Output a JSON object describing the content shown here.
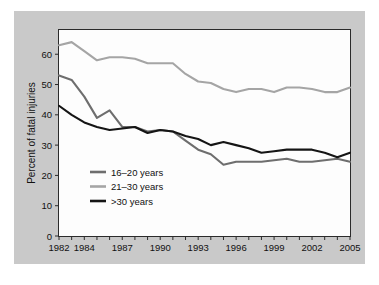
{
  "figure": {
    "background_color": "#ffffff",
    "matte_color": "#c9c9c9",
    "plot_background_color": "#fdfdfd",
    "plot_border_color": "#2b2b2b"
  },
  "chart_data": {
    "type": "line",
    "title": "",
    "xlabel": "",
    "ylabel": "Percent of fatal injuries",
    "xlim": [
      1982,
      2005
    ],
    "ylim": [
      0,
      68
    ],
    "yticks": [
      0,
      10,
      20,
      30,
      40,
      50,
      60
    ],
    "ytick_labels": [
      "0",
      "10",
      "20",
      "30",
      "40",
      "50",
      "60"
    ],
    "xticks": [
      1982,
      1983,
      1984,
      1985,
      1986,
      1987,
      1988,
      1989,
      1990,
      1991,
      1992,
      1993,
      1994,
      1995,
      1996,
      1997,
      1998,
      1999,
      2000,
      2001,
      2002,
      2003,
      2004,
      2005
    ],
    "xtick_labels_shown": [
      "1982",
      "1984",
      "1987",
      "1990",
      "1993",
      "1996",
      "1999",
      "2002",
      "2005"
    ],
    "xtick_label_years": [
      1982,
      1984,
      1987,
      1990,
      1993,
      1996,
      1999,
      2002,
      2005
    ],
    "grid": false,
    "legend_position": "lower left inside plot",
    "x": [
      1982,
      1983,
      1984,
      1985,
      1986,
      1987,
      1988,
      1989,
      1990,
      1991,
      1992,
      1993,
      1994,
      1995,
      1996,
      1997,
      1998,
      1999,
      2000,
      2001,
      2002,
      2003,
      2004,
      2005
    ],
    "series": [
      {
        "name": "16-20 years",
        "label": "16–20 years",
        "color": "#6e6e6e",
        "values": [
          53.0,
          51.5,
          46.0,
          39.0,
          41.5,
          36.0,
          36.0,
          34.5,
          35.0,
          34.5,
          31.5,
          28.5,
          27.0,
          23.5,
          24.5,
          24.5,
          24.5,
          25.0,
          25.5,
          24.5,
          24.5,
          25.0,
          25.5,
          24.5
        ]
      },
      {
        "name": "21-30 years",
        "label": "21–30 years",
        "color": "#a5a5a5",
        "values": [
          63.0,
          64.0,
          61.0,
          58.0,
          59.0,
          59.0,
          58.5,
          57.0,
          57.0,
          57.0,
          53.5,
          51.0,
          50.5,
          48.5,
          47.5,
          48.5,
          48.5,
          47.5,
          49.0,
          49.0,
          48.5,
          47.5,
          47.5,
          49.0
        ]
      },
      {
        "name": ">30 years",
        "label": ">30 years",
        "color": "#151515",
        "values": [
          43.0,
          40.0,
          37.5,
          36.0,
          35.0,
          35.5,
          36.0,
          34.0,
          35.0,
          34.5,
          33.0,
          32.0,
          30.0,
          31.0,
          30.0,
          29.0,
          27.5,
          28.0,
          28.5,
          28.5,
          28.5,
          27.5,
          26.0,
          27.5
        ]
      }
    ],
    "legend_entries": [
      {
        "label": "16–20 years",
        "color": "#6e6e6e"
      },
      {
        "label": "21–30 years",
        "color": "#a5a5a5"
      },
      {
        "label": ">30 years",
        "color": "#151515"
      }
    ]
  }
}
